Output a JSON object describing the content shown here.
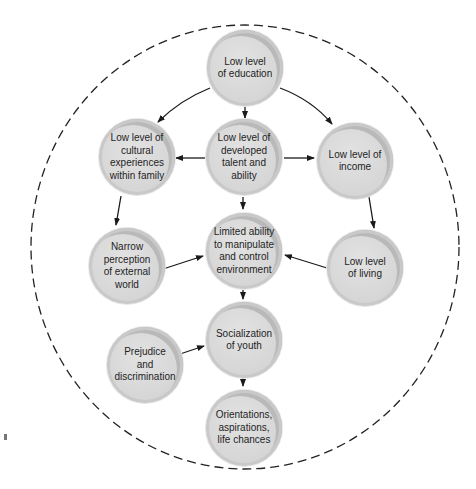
{
  "diagram": {
    "type": "cycle-of-poverty flowchart",
    "boundary": "dashed circle enclosing all nodes",
    "colors": {
      "node_fill": "#d8d8d8",
      "node_rim": "#b9b9b9",
      "arrow": "#1a1a1a",
      "boundary": "#222222",
      "text": "#1e1e1e"
    },
    "nodes": [
      {
        "id": "education",
        "label": "Low level\nof education"
      },
      {
        "id": "cultural",
        "label": "Low level of\ncultural\nexperiences\nwithin family"
      },
      {
        "id": "talent",
        "label": "Low level of\ndeveloped\ntalent and\nability"
      },
      {
        "id": "income",
        "label": "Low level of\nincome"
      },
      {
        "id": "narrow",
        "label": "Narrow\nperception\nof external\nworld"
      },
      {
        "id": "limited",
        "label": "Limited ability\nto  manipulate\nand control\nenvironment"
      },
      {
        "id": "living",
        "label": "Low level\nof living"
      },
      {
        "id": "socialization",
        "label": "Socialization\nof youth"
      },
      {
        "id": "prejudice",
        "label": "Prejudice\nand\ndiscrimination"
      },
      {
        "id": "orientations",
        "label": "Orientations,\naspirations,\nlife chances"
      }
    ],
    "edges": [
      {
        "from": "education",
        "to": "cultural"
      },
      {
        "from": "education",
        "to": "talent"
      },
      {
        "from": "education",
        "to": "income"
      },
      {
        "from": "talent",
        "to": "cultural"
      },
      {
        "from": "talent",
        "to": "income"
      },
      {
        "from": "talent",
        "to": "limited"
      },
      {
        "from": "cultural",
        "to": "narrow"
      },
      {
        "from": "income",
        "to": "living"
      },
      {
        "from": "narrow",
        "to": "limited"
      },
      {
        "from": "living",
        "to": "limited"
      },
      {
        "from": "limited",
        "to": "socialization"
      },
      {
        "from": "prejudice",
        "to": "socialization"
      },
      {
        "from": "socialization",
        "to": "orientations"
      }
    ]
  }
}
